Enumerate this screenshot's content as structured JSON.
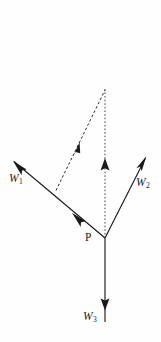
{
  "figure": {
    "kind": "force-vector-diagram",
    "background_color": "#fefefe",
    "stroke_color": "#1a1a1a",
    "width": 161,
    "height": 342,
    "labels": {
      "w1": "W",
      "w1_sub": "1",
      "w2": "W",
      "w2_sub": "2",
      "w3": "W",
      "w3_sub": "3",
      "point_p": "P"
    },
    "geometry": {
      "vertex_p": [
        105,
        238
      ],
      "apex": [
        105,
        90
      ],
      "w1_tip": [
        13,
        161
      ],
      "w2_tip": [
        146,
        157
      ],
      "w3_tip": [
        105,
        322
      ],
      "dashed_base": [
        56,
        190
      ],
      "w1_mid_arrow": [
        76,
        216
      ],
      "dashed_mid_arrow": [
        78,
        146
      ],
      "dotted_mid_arrow": [
        105,
        163
      ],
      "w3_arrow": [
        105,
        307
      ]
    },
    "elements": [
      {
        "name": "w1-vector",
        "style": "solid",
        "direction": "up-left"
      },
      {
        "name": "w2-vector",
        "style": "solid",
        "direction": "up-right"
      },
      {
        "name": "w3-vector",
        "style": "solid",
        "direction": "down"
      },
      {
        "name": "dashed-resultant",
        "style": "dashed",
        "direction": "up-right"
      },
      {
        "name": "dotted-vertical",
        "style": "dotted",
        "direction": "up"
      }
    ]
  }
}
